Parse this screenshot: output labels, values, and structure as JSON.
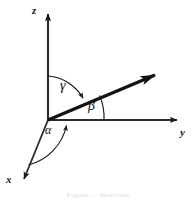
{
  "figure": {
    "caption": "Figure  —  direction",
    "background_color": "#ffffff",
    "stroke_color": "#1a1a1a"
  },
  "axes": [
    {
      "id": "z",
      "label": "z",
      "direction": "up"
    },
    {
      "id": "y",
      "label": "y",
      "direction": "right"
    },
    {
      "id": "x",
      "label": "x",
      "direction": "down-left"
    }
  ],
  "angles": [
    {
      "id": "gamma",
      "label": "γ",
      "from_axis": "z",
      "to": "vector"
    },
    {
      "id": "beta",
      "label": "β",
      "from_axis": "y",
      "to": "vector"
    },
    {
      "id": "alpha",
      "label": "α",
      "from_axis": "x",
      "to": "vector"
    }
  ],
  "vector": {
    "name": "direction-vector",
    "origin": [
      48,
      120
    ],
    "tip": [
      168,
      70
    ]
  },
  "geometry": {
    "origin_x": 48,
    "origin_y": 120,
    "z_tip_y": 10,
    "y_tip_x": 182,
    "x_tip": [
      21,
      186
    ]
  }
}
